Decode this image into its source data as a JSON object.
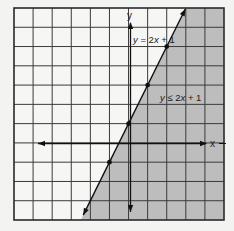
{
  "chart_data": {
    "type": "line",
    "title": "",
    "xlabel": "x",
    "ylabel": "y",
    "xlim": [
      -6,
      5
    ],
    "ylim": [
      -4,
      7
    ],
    "grid": true,
    "grid_step": 1,
    "series": [
      {
        "name": "y = 2x + 1",
        "kind": "boundary-line",
        "style": "solid",
        "slope": 2,
        "intercept": 1,
        "points": [
          [
            -1,
            -1
          ],
          [
            0,
            1
          ],
          [
            1,
            3
          ],
          [
            2,
            5
          ]
        ],
        "arrows": "both"
      }
    ],
    "shaded_region": {
      "inequality": "y ≤ 2x + 1",
      "side": "below-right",
      "color": "#bdbdbd"
    },
    "annotations": [
      {
        "text": "y = 2x + 1",
        "near": [
          1.6,
          5.5
        ]
      },
      {
        "text": "y ≤ 2x + 1",
        "near": [
          3.2,
          2.4
        ]
      }
    ]
  },
  "labels": {
    "x_axis": "x",
    "y_axis": "y",
    "line_eq": {
      "y": "y",
      "rest": " = 2",
      "x": "x",
      "tail": " + 1"
    },
    "ineq": {
      "y": "y",
      "rest": " ≤ 2",
      "x": "x",
      "tail": " + 1"
    }
  },
  "colors": {
    "background": "#f3f3f1",
    "shade": "#bdbdbd",
    "grid": "#3a3a3a",
    "line": "#111111"
  }
}
